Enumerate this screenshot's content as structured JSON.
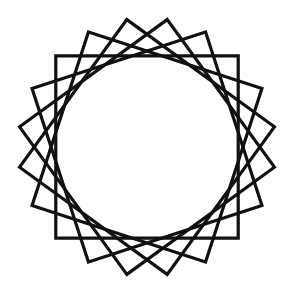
{
  "figure": {
    "center": [
      147,
      147
    ],
    "corner_radius": 129,
    "shape_count": 5,
    "shape_sides": 4,
    "rotation_step_deg": 18,
    "base_rotation_deg": 45,
    "stroke_color": "#111111",
    "stroke_width": 3.2,
    "background": "#ffffff"
  }
}
